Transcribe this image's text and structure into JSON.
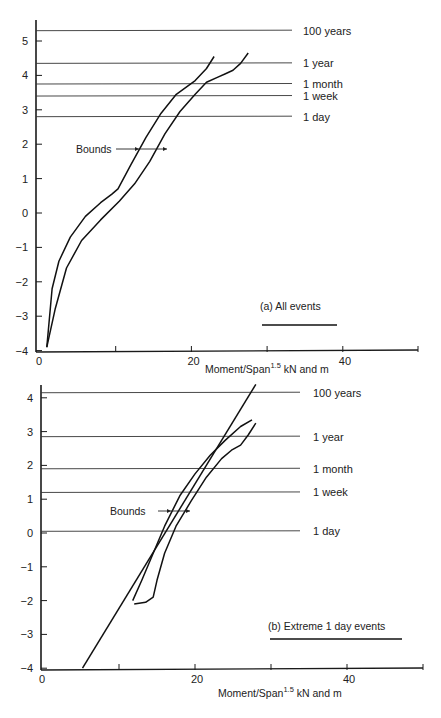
{
  "chart_data": [
    {
      "type": "line",
      "panel": "(a)",
      "title": "(a)  All events",
      "xlabel": "Moment/Span",
      "xlabel_superscript": "1.5",
      "xlabel_suffix": " kN and m",
      "ylabel": "",
      "xlim": [
        0,
        50
      ],
      "ylim": [
        -4,
        5.5
      ],
      "x_ticks": [
        0,
        10,
        20,
        30,
        40,
        50
      ],
      "x_tick_labels": [
        "0",
        "20",
        "40"
      ],
      "y_ticks": [
        -4,
        -3,
        -2,
        -1,
        0,
        1,
        2,
        3,
        4,
        5
      ],
      "y_tick_labels": [
        "-4",
        "-3",
        "-2",
        "-1",
        "0",
        "1",
        "2",
        "3",
        "4",
        "5"
      ],
      "grid": false,
      "reference_lines": [
        {
          "label": "100 years",
          "y": 5.3
        },
        {
          "label": "1 year",
          "y": 4.35
        },
        {
          "label": "1 month",
          "y": 3.75
        },
        {
          "label": "1 week",
          "y": 3.4
        },
        {
          "label": "1 day",
          "y": 2.8
        }
      ],
      "annotations": [
        {
          "text": "Bounds",
          "x": 8,
          "y": 1.9
        }
      ],
      "series": [
        {
          "name": "Upper bound (left)",
          "x": [
            0.9,
            1.6,
            2.5,
            4.0,
            6.0,
            8.0,
            9.5,
            10.3,
            12.0,
            14.0,
            16.0,
            18.0,
            20.5,
            22.0,
            23.0
          ],
          "y": [
            -3.9,
            -2.2,
            -1.4,
            -0.7,
            -0.1,
            0.3,
            0.55,
            0.7,
            1.4,
            2.2,
            2.9,
            3.45,
            3.85,
            4.2,
            4.55
          ]
        },
        {
          "name": "Lower bound (right)",
          "x": [
            0.9,
            2.0,
            3.5,
            5.5,
            8.0,
            10.5,
            12.5,
            14.5,
            16.5,
            18.5,
            20.5,
            22.0,
            23.5,
            24.5,
            25.5,
            26.5,
            27.5
          ],
          "y": [
            -3.9,
            -2.8,
            -1.6,
            -0.8,
            -0.2,
            0.35,
            0.85,
            1.5,
            2.3,
            2.95,
            3.45,
            3.8,
            3.95,
            4.05,
            4.15,
            4.35,
            4.65
          ]
        }
      ]
    },
    {
      "type": "line",
      "panel": "(b)",
      "title": "(b)  Extreme 1 day events",
      "xlabel": "Moment/Span",
      "xlabel_superscript": "1.5",
      "xlabel_suffix": " kN and m",
      "ylabel": "",
      "xlim": [
        0,
        50
      ],
      "ylim": [
        -4,
        4.3
      ],
      "x_ticks": [
        0,
        10,
        20,
        30,
        40,
        50
      ],
      "x_tick_labels": [
        "0",
        "20",
        "40"
      ],
      "y_ticks": [
        -4,
        -3,
        -2,
        -1,
        0,
        1,
        2,
        3,
        4
      ],
      "y_tick_labels": [
        "-4",
        "-3",
        "-2",
        "-1",
        "0",
        "1",
        "2",
        "3",
        "4"
      ],
      "grid": false,
      "reference_lines": [
        {
          "label": "100 years",
          "y": 4.15
        },
        {
          "label": "1 year",
          "y": 2.85
        },
        {
          "label": "1 month",
          "y": 1.9
        },
        {
          "label": "1 week",
          "y": 1.2
        },
        {
          "label": "1 day",
          "y": 0.05
        }
      ],
      "annotations": [
        {
          "text": "Bounds",
          "x": 13.5,
          "y": 0.6
        }
      ],
      "series": [
        {
          "name": "Fitted line",
          "x": [
            5.2,
            28.0
          ],
          "y": [
            -4.0,
            4.4
          ]
        },
        {
          "name": "Upper bound (left)",
          "x": [
            11.8,
            13.0,
            14.5,
            16.0,
            18.0,
            20.0,
            22.0,
            24.0,
            26.0,
            27.5
          ],
          "y": [
            -2.0,
            -1.4,
            -0.6,
            0.2,
            1.1,
            1.75,
            2.3,
            2.75,
            3.15,
            3.35
          ]
        },
        {
          "name": "Lower bound (right)",
          "x": [
            12.0,
            13.5,
            14.5,
            15.0,
            16.0,
            17.5,
            19.5,
            21.5,
            23.5,
            24.8,
            26.0,
            27.0,
            28.0
          ],
          "y": [
            -2.1,
            -2.05,
            -1.9,
            -1.4,
            -0.6,
            0.2,
            0.95,
            1.65,
            2.2,
            2.45,
            2.6,
            2.9,
            3.25
          ]
        }
      ]
    }
  ],
  "figure": {
    "top": {
      "panel_label": "(a)  All events",
      "annotation": "Bounds",
      "x_axis_title": "Moment/Span",
      "x_axis_sup": "1.5",
      "x_axis_suffix": " kN and m"
    },
    "bottom": {
      "panel_label": "(b)  Extreme 1 day events",
      "annotation": "Bounds",
      "x_axis_title": "Moment/Span",
      "x_axis_sup": "1.5",
      "x_axis_suffix": " kN and m"
    }
  }
}
